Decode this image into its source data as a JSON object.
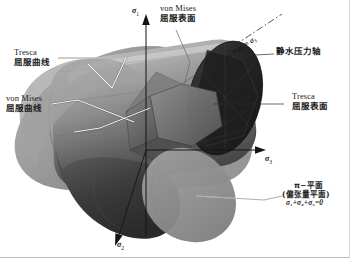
{
  "figure": {
    "title_alt": "Yield surfaces in principal stress space",
    "background": "#ffffff"
  },
  "axes": [
    {
      "id": "sigma1",
      "label": "σ",
      "sub": "1",
      "direction": "up"
    },
    {
      "id": "sigma2",
      "label": "σ",
      "sub": "2",
      "direction": "down-front"
    },
    {
      "id": "sigma3",
      "label": "σ",
      "sub": "3",
      "direction": "right"
    }
  ],
  "annotations": {
    "tresca_curve": {
      "en": "Tresca",
      "cn": "屈服曲线"
    },
    "von_mises_curve": {
      "en": "von Mises",
      "cn": "屈服曲线"
    },
    "von_mises_surface": {
      "en": "von Mises",
      "cn": "屈服表面"
    },
    "tresca_surface": {
      "en": "Tresca",
      "cn": "屈服表面"
    },
    "hydrostatic_axis": {
      "cn": "静水压力轴"
    },
    "hydrostatic_equation": {
      "text": "σ₁ = σ₂ = σ₃"
    },
    "pi_plane": {
      "line1": "π−平面",
      "line2": "(偏张量平面)",
      "line3_eq": "σ₁+σ₂+σ₃=0"
    }
  },
  "colors": {
    "background": "#ffffff",
    "axis_line": "#1a1a1a",
    "leader_light": "#f2f2f2",
    "leader_dark": "#3a3a3a",
    "cylinder_light": "#b9b9b9",
    "cylinder_mid": "#8e8e8e",
    "cylinder_dark": "#4a4a4a",
    "endcap_dark": "#2b2b2b",
    "prism_shade": "#6f6f6f",
    "plane_fill": "#9a9a9a"
  }
}
